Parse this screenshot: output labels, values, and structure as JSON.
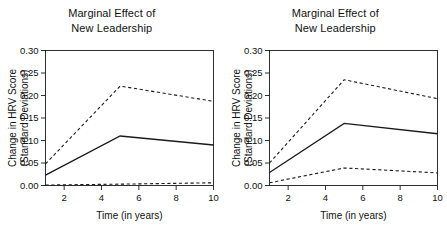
{
  "figure": {
    "background": "#ffffff",
    "line_color": "#1a1a1a"
  },
  "panels": [
    {
      "id": "left",
      "title_line1": "Marginal Effect of",
      "title_line2": "New Leadership",
      "xlabel": "Time (in years)",
      "ylabel_line1": "Change in HRV Score",
      "ylabel_line2": "(Standard Deviations)",
      "yticks": [
        "0.00",
        "0.05",
        "0.10",
        "0.15",
        "0.20",
        "0.25",
        "0.30"
      ],
      "xticks": [
        "2",
        "4",
        "6",
        "8",
        "10"
      ]
    },
    {
      "id": "right",
      "title_line1": "Marginal Effect of",
      "title_line2": "New Leadership",
      "xlabel": "Time (in years)",
      "ylabel_line1": "Change in HRV Score",
      "ylabel_line2": "(Standard Deviations)",
      "yticks": [
        "0.00",
        "0.05",
        "0.10",
        "0.15",
        "0.20",
        "0.25",
        "0.30"
      ],
      "xticks": [
        "2",
        "4",
        "6",
        "8",
        "10"
      ]
    }
  ],
  "chart_data": [
    {
      "type": "line",
      "panel": "left",
      "title": "Marginal Effect of New Leadership",
      "xlabel": "Time (in years)",
      "ylabel": "Change in HRV Score (Standard Deviations)",
      "x": [
        1,
        5,
        10
      ],
      "xlim": [
        1,
        10
      ],
      "ylim": [
        0.0,
        0.3
      ],
      "xticks": [
        2,
        4,
        6,
        8,
        10
      ],
      "yticks": [
        0.0,
        0.05,
        0.1,
        0.15,
        0.2,
        0.25,
        0.3
      ],
      "grid": false,
      "legend": "none",
      "series": [
        {
          "name": "Upper 95% CI",
          "style": "dashed",
          "values": [
            0.048,
            0.221,
            0.187
          ]
        },
        {
          "name": "Point estimate",
          "style": "solid",
          "values": [
            0.023,
            0.11,
            0.09
          ]
        },
        {
          "name": "Lower 95% CI",
          "style": "dashed",
          "values": [
            0.001,
            0.003,
            0.006
          ]
        }
      ]
    },
    {
      "type": "line",
      "panel": "right",
      "title": "Marginal Effect of New Leadership",
      "xlabel": "Time (in years)",
      "ylabel": "Change in HRV Score (Standard Deviations)",
      "x": [
        1,
        5,
        10
      ],
      "xlim": [
        1,
        10
      ],
      "ylim": [
        0.0,
        0.3
      ],
      "xticks": [
        2,
        4,
        6,
        8,
        10
      ],
      "yticks": [
        0.0,
        0.05,
        0.1,
        0.15,
        0.2,
        0.25,
        0.3
      ],
      "grid": false,
      "legend": "none",
      "series": [
        {
          "name": "Upper 95% CI",
          "style": "dashed",
          "values": [
            0.05,
            0.235,
            0.193
          ]
        },
        {
          "name": "Point estimate",
          "style": "solid",
          "values": [
            0.029,
            0.138,
            0.115
          ]
        },
        {
          "name": "Lower 95% CI",
          "style": "dashed",
          "values": [
            0.006,
            0.039,
            0.028
          ]
        }
      ]
    }
  ]
}
